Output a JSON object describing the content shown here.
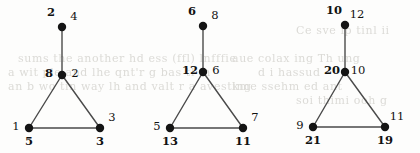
{
  "figure": {
    "background_color": "#fdfdfc",
    "node_color": "#141414",
    "edge_color": "#4a4a4a",
    "label_color": "#111111",
    "node_radius": 4.2
  },
  "ghost_text": {
    "description": "faint scanner bleed-through text visible behind the diagram",
    "color": "#dcdbd7",
    "lines": [
      {
        "text": "sums    the another  hd  ess  (ffl)  lnfffie",
        "x": 18,
        "y": 52
      },
      {
        "text": "a  wit   ple  and    lhe   qnt'r   g  bas  tl   in",
        "x": 8,
        "y": 66
      },
      {
        "text": "an  b wo  tin  way      lh and  valt  r a   avesting",
        "x": 8,
        "y": 80
      },
      {
        "text": "aue colax ing Th ung",
        "x": 232,
        "y": 52
      },
      {
        "text": "d   i   hassud",
        "x": 258,
        "y": 66
      },
      {
        "text": "kme   ssehm   ed   ant",
        "x": 232,
        "y": 80
      },
      {
        "text": "Ce sve  ip  tinl  ii",
        "x": 296,
        "y": 24
      },
      {
        "text": "soi   thimi     ooh   g",
        "x": 296,
        "y": 94
      }
    ]
  },
  "graphs": [
    {
      "id": "graph-1",
      "nodes": [
        {
          "id": "g1-top",
          "cx": 62,
          "cy": 27,
          "bold_label": "2",
          "bold_pos": "upper-left",
          "plain_label": "4",
          "plain_pos": "upper-right"
        },
        {
          "id": "g1-center",
          "cx": 62,
          "cy": 75,
          "bold_label": "8",
          "bold_pos": "left",
          "plain_label": "2",
          "plain_pos": "right"
        },
        {
          "id": "g1-left",
          "cx": 29,
          "cy": 128,
          "bold_label": "5",
          "bold_pos": "below",
          "plain_label": "1",
          "plain_pos": "left"
        },
        {
          "id": "g1-right",
          "cx": 100,
          "cy": 128,
          "bold_label": "3",
          "bold_pos": "below",
          "plain_label": "3",
          "plain_pos": "upper-right"
        }
      ],
      "edges": [
        {
          "from": "g1-top",
          "to": "g1-center"
        },
        {
          "from": "g1-center",
          "to": "g1-left"
        },
        {
          "from": "g1-center",
          "to": "g1-right"
        },
        {
          "from": "g1-left",
          "to": "g1-right"
        }
      ]
    },
    {
      "id": "graph-2",
      "nodes": [
        {
          "id": "g2-top",
          "cx": 203,
          "cy": 26,
          "bold_label": "6",
          "bold_pos": "upper-left",
          "plain_label": "8",
          "plain_pos": "upper-right"
        },
        {
          "id": "g2-center",
          "cx": 203,
          "cy": 72,
          "bold_label": "12",
          "bold_pos": "left",
          "plain_label": "6",
          "plain_pos": "right"
        },
        {
          "id": "g2-left",
          "cx": 170,
          "cy": 128,
          "bold_label": "13",
          "bold_pos": "below",
          "plain_label": "5",
          "plain_pos": "left"
        },
        {
          "id": "g2-right",
          "cx": 243,
          "cy": 128,
          "bold_label": "11",
          "bold_pos": "below",
          "plain_label": "7",
          "plain_pos": "upper-right"
        }
      ],
      "edges": [
        {
          "from": "g2-top",
          "to": "g2-center"
        },
        {
          "from": "g2-center",
          "to": "g2-left"
        },
        {
          "from": "g2-center",
          "to": "g2-right"
        },
        {
          "from": "g2-left",
          "to": "g2-right"
        }
      ]
    },
    {
      "id": "graph-3",
      "nodes": [
        {
          "id": "g3-top",
          "cx": 345,
          "cy": 25,
          "bold_label": "10",
          "bold_pos": "upper-left",
          "plain_label": "12",
          "plain_pos": "upper-right"
        },
        {
          "id": "g3-center",
          "cx": 345,
          "cy": 72,
          "bold_label": "20",
          "bold_pos": "left",
          "plain_label": "10",
          "plain_pos": "right"
        },
        {
          "id": "g3-left",
          "cx": 313,
          "cy": 127,
          "bold_label": "21",
          "bold_pos": "below",
          "plain_label": "9",
          "plain_pos": "left"
        },
        {
          "id": "g3-right",
          "cx": 385,
          "cy": 127,
          "bold_label": "19",
          "bold_pos": "below",
          "plain_label": "11",
          "plain_pos": "upper-right"
        }
      ],
      "edges": [
        {
          "from": "g3-top",
          "to": "g3-center"
        },
        {
          "from": "g3-center",
          "to": "g3-left"
        },
        {
          "from": "g3-center",
          "to": "g3-right"
        },
        {
          "from": "g3-left",
          "to": "g3-right"
        }
      ]
    }
  ]
}
